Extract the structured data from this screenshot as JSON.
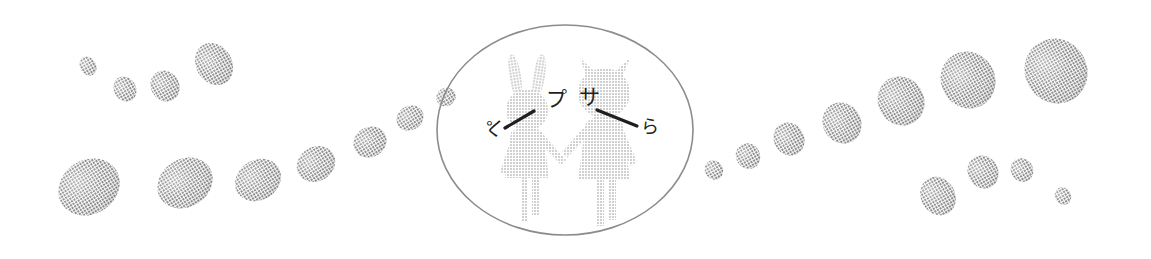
{
  "figure": {
    "title": "Two cartoon children holding hands inside an oval, flanked by chains of gray pebble shapes",
    "background_color": "#ffffff",
    "blob_color": "#9b9b9b",
    "blob_color_light": "#a8a8a8",
    "outline_color": "#8c8c8c",
    "character_fill": "#d2d2d2",
    "ink_color": "#1f1f1f",
    "width": 1151,
    "height": 259
  },
  "oval_frame": {
    "name": "center-oval-outline",
    "cx": 565,
    "cy": 130,
    "rx": 128,
    "ry": 105,
    "stroke": "#8c8c8c",
    "stroke_width": 1.6,
    "fill": "none"
  },
  "characters": [
    {
      "id": "rabbit-child",
      "label": "rabbit-eared child",
      "head_type": "rabbit-ears",
      "fill": "#d2d2d2",
      "center_x": 527,
      "center_y": 145
    },
    {
      "id": "horned-child",
      "label": "horned pigtailed child",
      "head_type": "horns",
      "fill": "#d2d2d2",
      "center_x": 604,
      "center_y": 145
    }
  ],
  "handwriting": [
    {
      "id": "mark-left",
      "text": "ペ",
      "x": 495,
      "y": 128,
      "rotation": -90,
      "size": 19
    },
    {
      "id": "mark-inner-left",
      "text": "プ",
      "x": 556,
      "y": 100,
      "rotation": 0,
      "size": 21
    },
    {
      "id": "mark-inner-right",
      "text": "サ",
      "x": 589,
      "y": 98,
      "rotation": 0,
      "size": 21
    },
    {
      "id": "mark-right",
      "text": "ら",
      "x": 650,
      "y": 128,
      "rotation": 0,
      "size": 18
    }
  ],
  "ink_strokes": [
    {
      "id": "stroke-left-arm",
      "x1": 505,
      "y1": 128,
      "x2": 534,
      "y2": 111
    },
    {
      "id": "stroke-right-arm",
      "x1": 597,
      "y1": 110,
      "x2": 637,
      "y2": 126
    }
  ],
  "blobs": {
    "upper_left_chain": [
      {
        "cx": 88,
        "cy": 66,
        "rx": 8,
        "ry": 10,
        "rot": -30
      },
      {
        "cx": 125,
        "cy": 89,
        "rx": 11,
        "ry": 13,
        "rot": -30
      },
      {
        "cx": 165,
        "cy": 86,
        "rx": 14,
        "ry": 16,
        "rot": -30
      },
      {
        "cx": 214,
        "cy": 64,
        "rx": 18,
        "ry": 22,
        "rot": -30
      }
    ],
    "lower_left_chain": [
      {
        "cx": 89,
        "cy": 187,
        "rx": 32,
        "ry": 27,
        "rot": -32
      },
      {
        "cx": 185,
        "cy": 183,
        "rx": 29,
        "ry": 24,
        "rot": -32
      },
      {
        "cx": 258,
        "cy": 180,
        "rx": 24,
        "ry": 20,
        "rot": -32
      },
      {
        "cx": 316,
        "cy": 164,
        "rx": 20,
        "ry": 17,
        "rot": -32
      },
      {
        "cx": 370,
        "cy": 142,
        "rx": 17,
        "ry": 15,
        "rot": -32
      },
      {
        "cx": 410,
        "cy": 118,
        "rx": 14,
        "ry": 12,
        "rot": -32
      },
      {
        "cx": 446,
        "cy": 97,
        "rx": 10,
        "ry": 9,
        "rot": -32
      }
    ],
    "right_ascending_chain": [
      {
        "cx": 714,
        "cy": 170,
        "rx": 9,
        "ry": 10,
        "rot": -30
      },
      {
        "cx": 748,
        "cy": 156,
        "rx": 12,
        "ry": 13,
        "rot": -30
      },
      {
        "cx": 789,
        "cy": 139,
        "rx": 15,
        "ry": 17,
        "rot": -30
      },
      {
        "cx": 842,
        "cy": 123,
        "rx": 19,
        "ry": 21,
        "rot": -30
      },
      {
        "cx": 901,
        "cy": 101,
        "rx": 23,
        "ry": 25,
        "rot": -30
      },
      {
        "cx": 968,
        "cy": 80,
        "rx": 27,
        "ry": 29,
        "rot": -30
      },
      {
        "cx": 1056,
        "cy": 71,
        "rx": 31,
        "ry": 33,
        "rot": -30
      }
    ],
    "lower_right_chain": [
      {
        "cx": 938,
        "cy": 196,
        "rx": 17,
        "ry": 20,
        "rot": -30
      },
      {
        "cx": 983,
        "cy": 172,
        "rx": 15,
        "ry": 17,
        "rot": -30
      },
      {
        "cx": 1022,
        "cy": 170,
        "rx": 11,
        "ry": 12,
        "rot": -30
      },
      {
        "cx": 1063,
        "cy": 196,
        "rx": 8,
        "ry": 9,
        "rot": -30
      }
    ]
  }
}
